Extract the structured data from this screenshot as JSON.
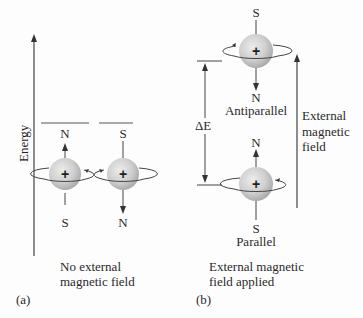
{
  "panel_a": {
    "axis_label": "Energy",
    "level_left": {
      "top_pole": "N",
      "bottom_pole": "S"
    },
    "level_right": {
      "top_pole": "S",
      "bottom_pole": "N"
    },
    "nucleus_symbol": "+",
    "caption_line1": "No external",
    "caption_line2": "magnetic field",
    "tag": "(a)"
  },
  "panel_b": {
    "antiparallel": {
      "top_pole": "S",
      "bottom_pole": "N",
      "label": "Antiparallel"
    },
    "parallel": {
      "top_pole": "N",
      "bottom_pole": "S",
      "label": "Parallel"
    },
    "nucleus_symbol": "+",
    "delta_label": "ΔE",
    "field_label_line1": "External",
    "field_label_line2": "magnetic",
    "field_label_line3": "field",
    "caption_line1": "External magnetic",
    "caption_line2": "field applied",
    "tag": "(b)"
  },
  "colors": {
    "sphere_light": "#e6e6e6",
    "sphere_dark": "#a9a9a9",
    "line": "#333333"
  }
}
